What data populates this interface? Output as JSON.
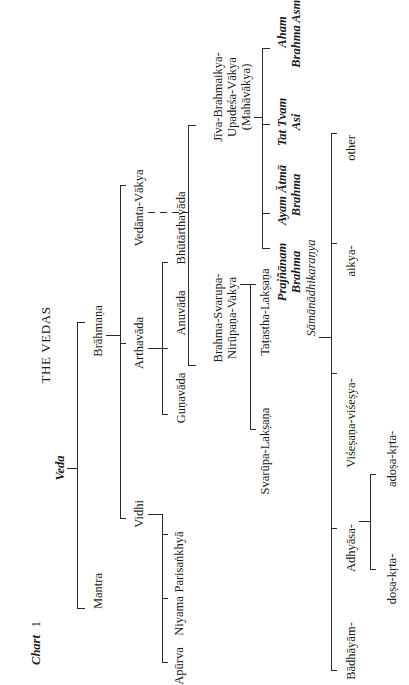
{
  "page": {
    "caption_word": "Chart",
    "caption_number": "1",
    "title": "THE VEDAS"
  },
  "tree": {
    "root": "Veda",
    "level1": {
      "mantra": "Mantra",
      "brahmana": "Brāhmaṇa"
    },
    "level2": {
      "vidhi": "Vidhi",
      "arthavada": "Arthavāda",
      "vedanta_vakya": "Vedānta-Vākya"
    },
    "vidhi_children": [
      "Apūrva",
      "Niyama",
      "Parisaṅkhyā"
    ],
    "arthavada_children": [
      "Guṇavāda",
      "Anuvāda",
      "Bhūtārthavāda"
    ],
    "vedanta_children": {
      "brahma_svarupa": [
        "Brahma-Svarupa-",
        "Nirūpaṇa-Vakya"
      ],
      "jiva_brahmaikya": [
        "Jīva-Brahmaikya-",
        "Upadeśa-Vākya",
        "(Mahāvākya)"
      ]
    },
    "brahma_svarupa_children": [
      "Svarūpa-Lakṣaṇa",
      "Taṭastha-Lakṣaṇa"
    ],
    "mahavakya_children": [
      [
        "Prajñānam",
        "Brahma"
      ],
      [
        "Ayam Ātmā",
        "Brahma"
      ],
      [
        "Tat Tvam",
        "Asi"
      ],
      [
        "Aham",
        "Brahma Asmi"
      ]
    ],
    "samanadhikaranya": "Sāmānādhikaraṇya",
    "samanadhikaranya_children": [
      "Bādhāyām-",
      "Adhyāsa-",
      "Viśeṣaṇa-viśeṣya-",
      "aikya-",
      "other"
    ],
    "adhyasa_children": [
      "doṣa-kṛta-",
      "adoṣa-kṛta-"
    ]
  }
}
